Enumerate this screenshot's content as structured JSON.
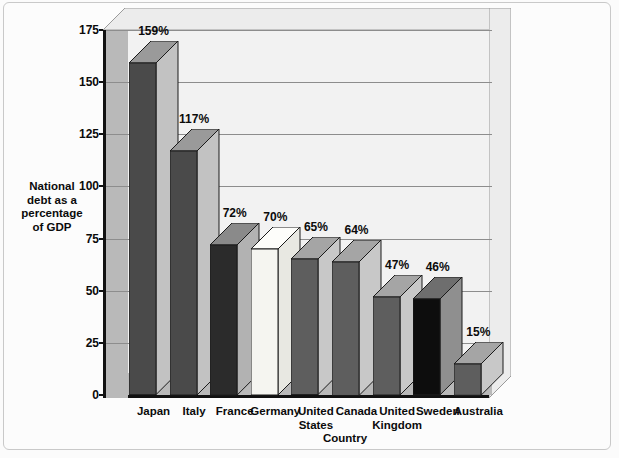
{
  "chart_data": {
    "type": "bar",
    "title": "",
    "xlabel": "Country",
    "ylabel": "National debt as a percentage of GDP",
    "ylabel_lines": [
      "National",
      "debt as a",
      "percentage",
      "of  GDP"
    ],
    "categories": [
      "Japan",
      "Italy",
      "France",
      "Germany",
      "United States",
      "Canada",
      "United Kingdom",
      "Sweden",
      "Australia"
    ],
    "category_lines": [
      [
        "Japan"
      ],
      [
        "Italy"
      ],
      [
        "France"
      ],
      [
        "Germany"
      ],
      [
        "United",
        "States"
      ],
      [
        "Canada"
      ],
      [
        "United",
        "Kingdom"
      ],
      [
        "Sweden"
      ],
      [
        "Australia"
      ]
    ],
    "values": [
      159,
      117,
      72,
      70,
      65,
      64,
      47,
      46,
      15
    ],
    "data_labels": [
      "159%",
      "117%",
      "72%",
      "70%",
      "65%",
      "64%",
      "47%",
      "46%",
      "15%"
    ],
    "ylim": [
      0,
      175
    ],
    "yticks": [
      0,
      25,
      50,
      75,
      100,
      125,
      150,
      175
    ],
    "ytick_labels": [
      "0",
      "25",
      "50",
      "75",
      "100",
      "125",
      "150",
      "175"
    ],
    "grid": true,
    "legend": "none",
    "style": "3d-bar",
    "bar_colors": [
      "#4a4a4a",
      "#4a4a4a",
      "#2b2b2b",
      "#f5f5f0",
      "#5e5e5e",
      "#5e5e5e",
      "#5e5e5e",
      "#0d0d0d",
      "#5e5e5e"
    ],
    "bar_top_colors": [
      "#9a9a9a",
      "#9a9a9a",
      "#8a8a8a",
      "#fdfdfa",
      "#a5a5a5",
      "#a5a5a5",
      "#a5a5a5",
      "#6e6e6e",
      "#a5a5a5"
    ],
    "bar_side_colors": [
      "#c2c2c2",
      "#c2c2c2",
      "#b2b2b2",
      "#e8e8e2",
      "#c8c8c8",
      "#c8c8c8",
      "#c8c8c8",
      "#8f8f8f",
      "#c8c8c8"
    ],
    "plot_bg_color": "#f2f2f2",
    "wall_color": "#b9b9b9",
    "gridline_color": "#8d8d8d",
    "axis_color": "#111111"
  }
}
